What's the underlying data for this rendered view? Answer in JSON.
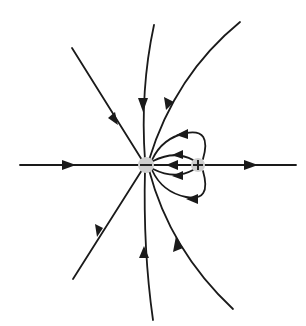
{
  "diagram": {
    "charges": [
      {
        "id": "negative",
        "sign": "−",
        "x": 146,
        "y": 165,
        "fill": "#cfcfcf"
      },
      {
        "id": "positive",
        "sign": "+",
        "x": 198,
        "y": 165,
        "fill": "#cfcfcf"
      }
    ],
    "field_lines": [
      {
        "id": "left-horizontal",
        "direction": "toward negative"
      },
      {
        "id": "upper-left",
        "direction": "toward negative"
      },
      {
        "id": "upper-middle",
        "direction": "toward negative"
      },
      {
        "id": "upper-right",
        "direction": "toward negative"
      },
      {
        "id": "lower-left",
        "direction": "toward negative"
      },
      {
        "id": "lower-middle",
        "direction": "toward negative"
      },
      {
        "id": "lower-right",
        "direction": "toward negative"
      },
      {
        "id": "right-horizontal",
        "direction": "away from positive"
      },
      {
        "id": "loop-top-outer",
        "direction": "positive to negative"
      },
      {
        "id": "loop-top-inner",
        "direction": "positive to negative"
      },
      {
        "id": "center",
        "direction": "positive to negative"
      },
      {
        "id": "loop-bottom-inner",
        "direction": "positive to negative"
      },
      {
        "id": "loop-bottom-outer",
        "direction": "positive to negative"
      }
    ],
    "colors": {
      "line": "#1a1a1a",
      "charge": "#cfcfcf",
      "background": "#ffffff"
    }
  }
}
